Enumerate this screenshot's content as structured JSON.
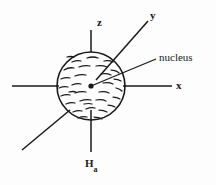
{
  "figure": {
    "background_color": "#fdfdfd",
    "stroke_color": "#1a1a1a",
    "labels": {
      "z_axis": "z",
      "y_axis": "y",
      "x_axis": "x",
      "field_axis": "H",
      "field_axis_subscript": "a",
      "nucleus": "nucleus"
    },
    "icons": {
      "nucleus_point": "nucleus-dot-icon",
      "electron_cloud": "electron-cloud-hatching-icon"
    },
    "geometry": {
      "circle_center_x": 91,
      "circle_center_y": 86,
      "circle_radius": 34,
      "z_axis_top_y": 30,
      "ha_axis_bottom_y": 152,
      "x_axis_right_x": 172,
      "left_axis_start_x": 12,
      "y_axis_tip_x": 148,
      "y_axis_tip_y": 21,
      "minus_y_tip_x": 22,
      "minus_y_tip_y": 150,
      "leader_end_x": 156,
      "leader_end_y": 59
    }
  }
}
